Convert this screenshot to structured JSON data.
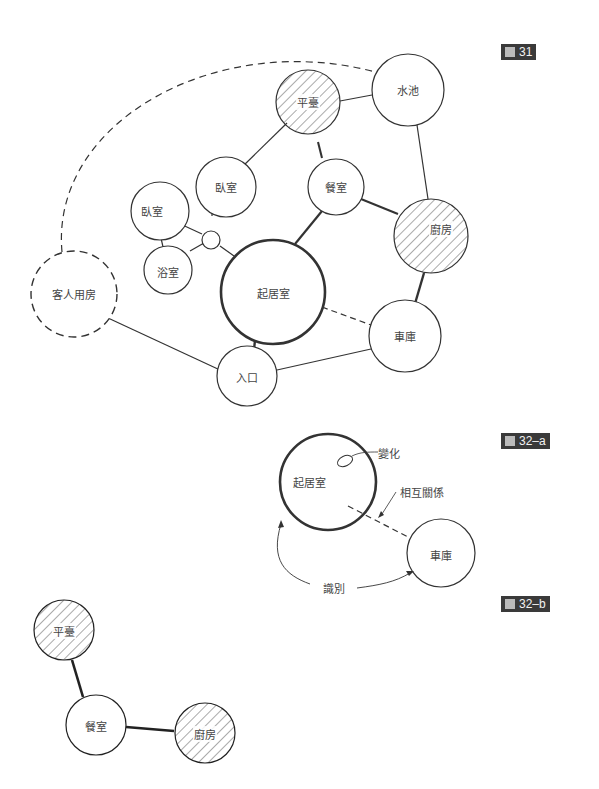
{
  "figures": {
    "fig31": {
      "label": "圖 31",
      "num": "31"
    },
    "fig32a": {
      "label": "圖 32-a",
      "num": "32–a"
    },
    "fig32b": {
      "label": "圖 32-b",
      "num": "32–b"
    }
  },
  "diagram31": {
    "nodes": [
      {
        "id": "terrace",
        "label": "平臺",
        "hatched": true
      },
      {
        "id": "pond",
        "label": "水池"
      },
      {
        "id": "bedroom1",
        "label": "臥室"
      },
      {
        "id": "bedroom2",
        "label": "臥室"
      },
      {
        "id": "dining",
        "label": "餐室"
      },
      {
        "id": "kitchen",
        "label": "廚房",
        "hatched": true
      },
      {
        "id": "bath",
        "label": "浴室"
      },
      {
        "id": "guest",
        "label": "客人用房",
        "dashed": true
      },
      {
        "id": "living",
        "label": "起居室",
        "thick": true
      },
      {
        "id": "garage",
        "label": "車庫"
      },
      {
        "id": "entrance",
        "label": "入口"
      }
    ]
  },
  "diagram32a": {
    "nodes": [
      {
        "id": "living",
        "label": "起居室"
      },
      {
        "id": "garage",
        "label": "車庫"
      }
    ],
    "annotations": {
      "change": "變化",
      "relation": "相互關係",
      "identify": "識別"
    }
  },
  "diagram32b": {
    "nodes": [
      {
        "id": "terrace",
        "label": "平臺"
      },
      {
        "id": "dining",
        "label": "餐室"
      },
      {
        "id": "kitchen",
        "label": "廚房"
      }
    ]
  }
}
